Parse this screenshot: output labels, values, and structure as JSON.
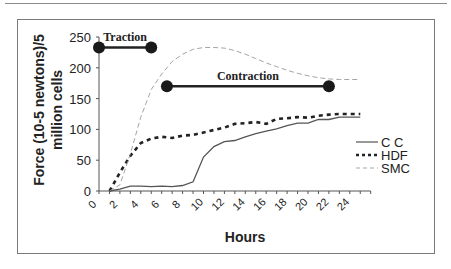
{
  "chart_data": {
    "type": "line",
    "title": "",
    "xlabel": "Hours",
    "ylabel_line1": "Force (10-5 newtons)/5",
    "ylabel_line2": "million cells",
    "xlim": [
      0,
      26
    ],
    "ylim": [
      0,
      250
    ],
    "xticks": [
      "0",
      "2",
      "4",
      "6",
      "8",
      "10",
      "12",
      "14",
      "16",
      "18",
      "20",
      "22",
      "24"
    ],
    "yticks": [
      "0",
      "50",
      "100",
      "150",
      "200",
      "250"
    ],
    "grid": false,
    "legend_position": "right",
    "series": [
      {
        "name": "C C",
        "style": "solid",
        "color": "#555555",
        "x": [
          1,
          2,
          3,
          4,
          5,
          6,
          7,
          8,
          9,
          10,
          11,
          12,
          13,
          14,
          15,
          16,
          17,
          18,
          19,
          20,
          21,
          22,
          23,
          24,
          25
        ],
        "values": [
          0,
          3,
          8,
          8,
          7,
          8,
          7,
          9,
          15,
          55,
          72,
          80,
          82,
          88,
          93,
          97,
          101,
          106,
          110,
          110,
          116,
          116,
          120,
          120,
          120
        ]
      },
      {
        "name": "HDF",
        "style": "dotted-bold",
        "color": "#222222",
        "x": [
          1,
          2,
          3,
          4,
          5,
          6,
          7,
          8,
          9,
          10,
          11,
          12,
          13,
          14,
          15,
          16,
          17,
          18,
          19,
          20,
          21,
          22,
          23,
          24,
          25
        ],
        "values": [
          0,
          30,
          57,
          78,
          85,
          88,
          86,
          90,
          91,
          95,
          99,
          103,
          109,
          110,
          112,
          109,
          117,
          118,
          120,
          119,
          122,
          124,
          125,
          125,
          125
        ]
      },
      {
        "name": "SMC",
        "style": "dashed-thin",
        "color": "#9a9a9a",
        "x": [
          1,
          2,
          3,
          4,
          5,
          6,
          7,
          8,
          9,
          10,
          11,
          12,
          13,
          14,
          15,
          16,
          17,
          18,
          19,
          20,
          21,
          22,
          23,
          24,
          25
        ],
        "values": [
          0,
          10,
          60,
          120,
          165,
          190,
          210,
          222,
          230,
          233,
          233,
          232,
          228,
          222,
          215,
          208,
          202,
          196,
          191,
          187,
          184,
          182,
          181,
          181,
          181
        ]
      }
    ],
    "annotations": [
      {
        "label": "Traction",
        "x_start": 0,
        "x_end": 5,
        "y": 233
      },
      {
        "label": "Contraction",
        "x_start": 6.5,
        "x_end": 22,
        "y": 170
      }
    ]
  },
  "legend": {
    "items": [
      {
        "label": "C  C"
      },
      {
        "label": "HDF"
      },
      {
        "label": "SMC"
      }
    ]
  }
}
